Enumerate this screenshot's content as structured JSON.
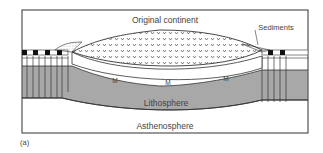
{
  "diagram": {
    "panel_label": "(a)",
    "labels": {
      "original_continent": "Original continent",
      "sediments": "Sediments",
      "lithosphere": "Lithosphere",
      "asthenosphere": "Asthenosphere",
      "moho_1": "M",
      "moho_2": "M",
      "moho_3": "M"
    },
    "colors": {
      "lithosphere": "#a8a8a8",
      "frame": "#333333",
      "text": "#444444",
      "background": "#ffffff"
    }
  }
}
